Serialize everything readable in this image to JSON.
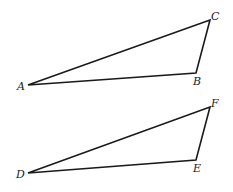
{
  "diagram": {
    "colors": {
      "stroke": "#1a1a1a",
      "background": "#ffffff"
    },
    "triangles": [
      {
        "name": "ABC",
        "vertices": [
          {
            "label": "A",
            "x": 28,
            "y": 85,
            "lx": 17,
            "ly": 90
          },
          {
            "label": "B",
            "x": 196,
            "y": 73,
            "lx": 193,
            "ly": 85
          },
          {
            "label": "C",
            "x": 210,
            "y": 20,
            "lx": 211,
            "ly": 20
          }
        ]
      },
      {
        "name": "DEF",
        "vertices": [
          {
            "label": "D",
            "x": 28,
            "y": 173,
            "lx": 16,
            "ly": 178
          },
          {
            "label": "E",
            "x": 196,
            "y": 160,
            "lx": 193,
            "ly": 172
          },
          {
            "label": "F",
            "x": 210,
            "y": 107,
            "lx": 211,
            "ly": 107
          }
        ]
      }
    ]
  }
}
